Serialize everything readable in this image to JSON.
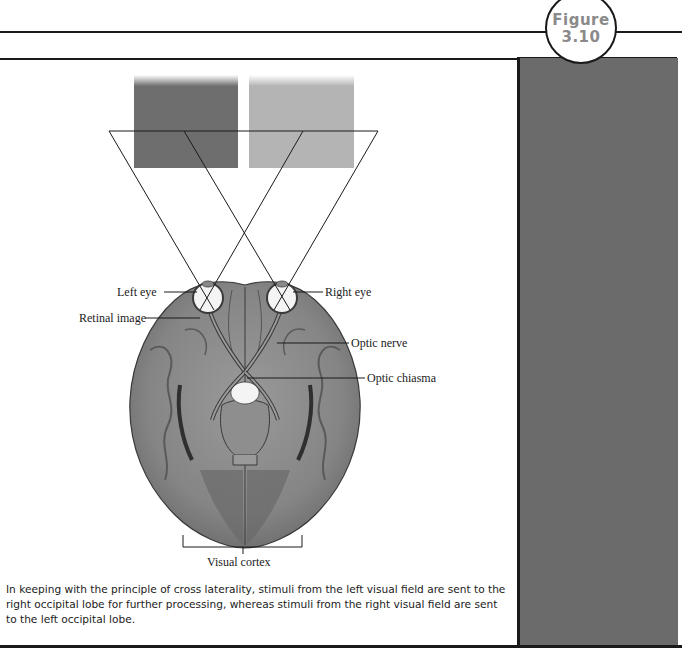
{
  "figure": {
    "badge_word": "Figure",
    "badge_number": "3.10"
  },
  "diagram": {
    "stimulus_squares": [
      {
        "position": "left",
        "color": "#6e6e6e"
      },
      {
        "position": "right",
        "color": "#b4b4b4"
      }
    ],
    "labels": {
      "left_eye": "Left eye",
      "right_eye": "Right eye",
      "retinal_image": "Retinal image",
      "optic_nerve": "Optic nerve",
      "optic_chiasma": "Optic chiasma",
      "visual_cortex": "Visual cortex"
    }
  },
  "caption": "In keeping with the principle of cross laterality, stimuli from the left visual field are sent to the right occipital lobe for further processing, whereas stimuli from the right visual field are sent to the left occipital lobe.",
  "colors": {
    "side_panel": "#6b6b6b",
    "rule_lines": "#1a1a1a",
    "badge_text": "#8a8a8a"
  }
}
